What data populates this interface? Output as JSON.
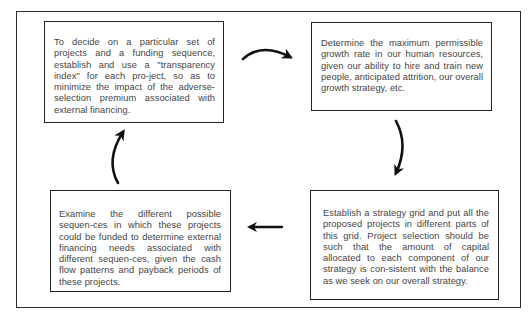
{
  "diagram": {
    "type": "cycle",
    "steps": [
      {
        "id": "step-transparency-index",
        "position": "top-left",
        "text": "To decide on a particular set of projects and a funding sequence, establish and use a \"transparency index\" for each pro-ject, so as to minimize the impact of the adverse-selection premium associated with external financing."
      },
      {
        "id": "step-growth-rate",
        "position": "top-right",
        "text": "Determine the maximum permissible growth rate in our human resources, given our ability to hire and train new people, anticipated attrition, our overall growth strategy, etc."
      },
      {
        "id": "step-funding-sequences",
        "position": "bottom-left",
        "text": "Examine the different possible sequen-ces in which these projects could be funded to determine external financing needs associated with different sequen-ces, given the cash flow patterns and payback periods of these projects."
      },
      {
        "id": "step-strategy-grid",
        "position": "bottom-right",
        "text": "Establish a strategy grid and put all the proposed projects in different parts of this grid. Project selection should be such that the amount of capital allocated to each component of our strategy is con-sistent with the balance as we seek on our overall strategy."
      }
    ],
    "flow": [
      {
        "from": "top-left",
        "to": "top-right",
        "arrow": "curved-right"
      },
      {
        "from": "top-right",
        "to": "bottom-right",
        "arrow": "curved-down"
      },
      {
        "from": "bottom-right",
        "to": "bottom-left",
        "arrow": "straight-left"
      },
      {
        "from": "bottom-left",
        "to": "top-left",
        "arrow": "curved-up"
      }
    ],
    "colors": {
      "border": "#222222",
      "text": "#444444",
      "arrow": "#111111",
      "background": "#ffffff"
    }
  }
}
